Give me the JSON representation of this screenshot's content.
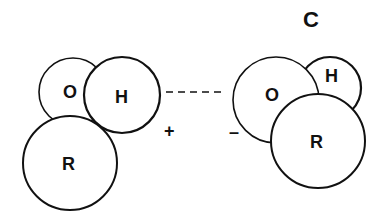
{
  "panel_label": "C",
  "left_molecule": {
    "atoms": [
      {
        "label": "O"
      },
      {
        "label": "H"
      },
      {
        "label": "R"
      }
    ],
    "charge": "+"
  },
  "right_molecule": {
    "atoms": [
      {
        "label": "O"
      },
      {
        "label": "H"
      },
      {
        "label": "R"
      }
    ],
    "charge": "–"
  },
  "bond": "hydrogen-bond-dashed",
  "colors": {
    "stroke": "#111111",
    "fill": "#ffffff"
  }
}
